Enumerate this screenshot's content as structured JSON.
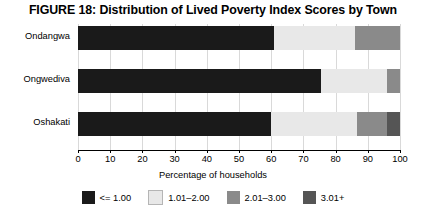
{
  "chart_data": {
    "type": "bar",
    "orientation": "horizontal",
    "stacked": true,
    "title": "FIGURE 18: Distribution of Lived Poverty Index Scores by Town",
    "xlabel": "Percentage of households",
    "ylabel": "",
    "xlim": [
      0,
      100
    ],
    "xticks": [
      "0",
      "10",
      "20",
      "30",
      "40",
      "50",
      "60",
      "70",
      "80",
      "90",
      "100"
    ],
    "grid": true,
    "legend_position": "bottom",
    "categories": [
      "Ondangwa",
      "Ongwediva",
      "Oshakati"
    ],
    "series": [
      {
        "name": "<= 1.00",
        "color": "#1a1a1a",
        "values": [
          61.0,
          75.5,
          60.0
        ]
      },
      {
        "name": "1.01-2.00",
        "color": "#e8e8e8",
        "values": [
          25.0,
          20.5,
          26.5
        ]
      },
      {
        "name": "2.01-3.00",
        "color": "#8a8a8a",
        "values": [
          14.0,
          4.0,
          9.5
        ]
      },
      {
        "name": "3.01+",
        "color": "#555555",
        "values": [
          0.0,
          0.0,
          4.0
        ]
      }
    ]
  },
  "legend": {
    "items": [
      {
        "label": "<= 1.00",
        "color": "#1a1a1a"
      },
      {
        "label": "1.01–2.00",
        "color": "#e8e8e8"
      },
      {
        "label": "2.01–3.00",
        "color": "#8a8a8a"
      },
      {
        "label": "3.01+",
        "color": "#555555"
      }
    ]
  }
}
